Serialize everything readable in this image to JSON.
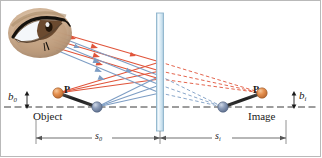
{
  "figure": {
    "labels": {
      "object": "Object",
      "image": "Image",
      "object_height": "b",
      "object_height_sub": "0",
      "image_height": "b",
      "image_height_sub": "i",
      "object_point": "P",
      "image_point": "P",
      "object_distance": "s",
      "object_distance_sub": "0",
      "image_distance": "s",
      "image_distance_sub": "i"
    },
    "colors": {
      "ray_red": "#e0543a",
      "ray_blue": "#7d9dc4",
      "mirror_fill": "#d6e7f2",
      "mirror_stroke": "#8fb4cc",
      "axis": "#3a3a3a",
      "object_bar": "#2b2b2b",
      "sphere_orange": "#e08b4c",
      "sphere_blue": "#8497b4",
      "eye_skin": "#c9a98a",
      "eye_iris": "#6b4a2f",
      "dimension_line": "#555555",
      "frame": "#b9b9b9"
    },
    "geometry": {
      "mirror_x": 160,
      "axis_y": 107,
      "object_point_x": 58,
      "object_point_y": 93,
      "object_base_x": 97,
      "object_base_y": 107,
      "image_point_x": 262,
      "image_point_y": 93,
      "image_base_x": 223,
      "image_base_y": 107,
      "eye_center_x": 40,
      "eye_center_y": 33
    },
    "elements": [
      "eye",
      "plane-mirror",
      "object-arrow",
      "image-arrow",
      "optical-axis",
      "incident-rays",
      "reflected-rays",
      "virtual-ray-extensions",
      "object-distance-dimension",
      "image-distance-dimension",
      "object-height-dimension",
      "image-height-dimension"
    ]
  }
}
